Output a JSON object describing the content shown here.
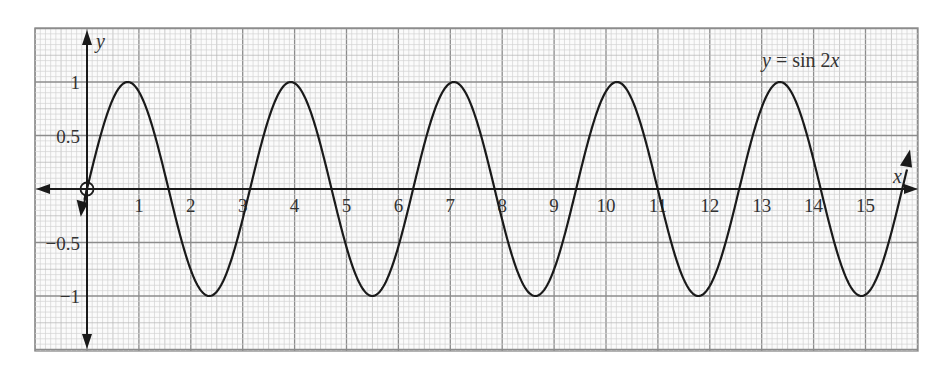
{
  "chart_data": {
    "type": "line",
    "title": "y = sin 2x",
    "function": "sin(2x)",
    "xlabel": "x",
    "ylabel": "y",
    "xlim": [
      -1,
      16
    ],
    "ylim": [
      -1.5,
      1.5
    ],
    "x_ticks": [
      1,
      2,
      3,
      4,
      5,
      6,
      7,
      8,
      9,
      10,
      11,
      12,
      13,
      14,
      15
    ],
    "y_ticks": [
      1,
      0.5,
      -0.5,
      -1
    ],
    "y_tick_labels": [
      "1",
      "0.5",
      "−0.5",
      "−1"
    ],
    "grid": true,
    "grid_style": "graph paper, major every 1 x-unit and 0.5 y-unit, 10 minor subdivisions",
    "curve_domain": [
      -0.05,
      15.8
    ],
    "open_circle_at": [
      0,
      0
    ],
    "series": [
      {
        "name": "y = sin 2x",
        "x": [
          0,
          0.785,
          1.571,
          2.356,
          3.142,
          3.927,
          4.712,
          5.498,
          6.283,
          7.069,
          7.854,
          8.639,
          9.425,
          10.21,
          10.996,
          11.781,
          12.566,
          13.352,
          14.137,
          14.923,
          15.7
        ],
        "values": [
          0,
          1,
          0,
          -1,
          0,
          1,
          0,
          -1,
          0,
          1,
          0,
          -1,
          0,
          1,
          0,
          -1,
          0,
          1,
          0,
          -1,
          -0.03
        ]
      }
    ],
    "annotation": {
      "text_y": "y",
      "text_eq": " = sin 2",
      "text_x": "x"
    }
  }
}
